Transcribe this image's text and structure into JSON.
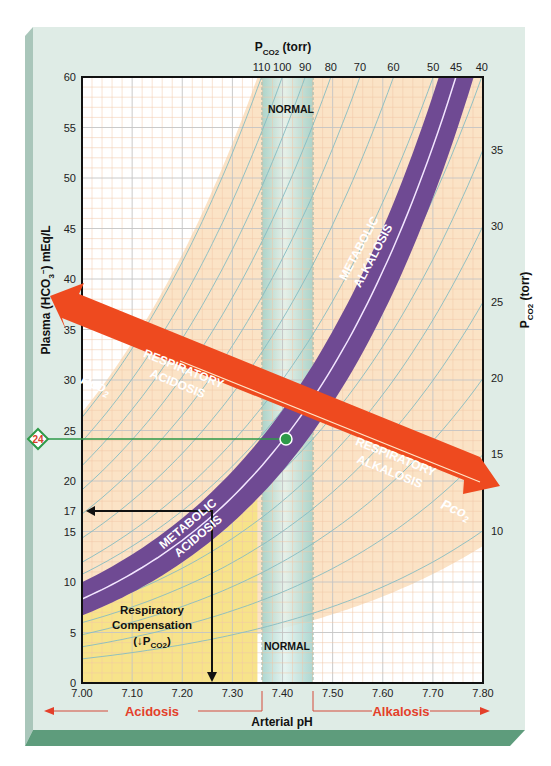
{
  "chart_data": {
    "type": "line",
    "xlabel": "Arterial pH",
    "ylabel": "Plasma (HCO3-) mEq/L",
    "top_axis_label": "PCO2 (torr)",
    "right_axis_label": "PCO2 (torr)",
    "xlim": [
      7.0,
      7.8
    ],
    "ylim": [
      0,
      60
    ],
    "x_ticks": [
      "7.00",
      "7.10",
      "7.20",
      "7.30",
      "7.40",
      "7.50",
      "7.60",
      "7.70",
      "7.80"
    ],
    "y_ticks": [
      "0",
      "5",
      "10",
      "15",
      "17",
      "20",
      "25",
      "30",
      "35",
      "40",
      "45",
      "50",
      "55",
      "60"
    ],
    "top_pco2_ticks": [
      "110",
      "100",
      "90",
      "80",
      "70",
      "60",
      "50",
      "45",
      "40"
    ],
    "right_pco2_ticks": [
      "35",
      "30",
      "25",
      "20",
      "15",
      "10"
    ],
    "isopleths_pco2": [
      110,
      100,
      90,
      80,
      70,
      60,
      50,
      45,
      40,
      35,
      30,
      25,
      20,
      15,
      10
    ],
    "normal_band_ph": [
      7.35,
      7.45
    ],
    "normal_point": {
      "ph": 7.4,
      "hco3": 24,
      "pco2": 40
    },
    "example_point": {
      "ph": 7.25,
      "hco3": 17
    },
    "regions": [
      {
        "name": "Metabolic alkalosis",
        "type": "band"
      },
      {
        "name": "Metabolic acidosis",
        "type": "band"
      },
      {
        "name": "Respiratory acidosis",
        "type": "arrow"
      },
      {
        "name": "Respiratory alkalosis",
        "type": "arrow"
      },
      {
        "name": "Respiratory compensation (↓PCO2)",
        "type": "area"
      }
    ],
    "grid": true
  },
  "labels": {
    "top_axis": "P",
    "top_axis_sub": "CO2",
    "top_axis_suffix": " (torr)",
    "right_axis": "P",
    "right_axis_sub": "CO2",
    "right_axis_suffix": " (torr)",
    "y_axis": "Plasma (HCO",
    "y_axis_sub": "3",
    "y_axis_sup": "−",
    "y_axis_suffix": ") mEq/L",
    "x_axis": "Arterial pH",
    "normal_top": "NORMAL",
    "normal_bottom": "NORMAL",
    "met_alk_1": "METABOLIC",
    "met_alk_2": "ALKALOSIS",
    "met_acid_1": "METABOLIC",
    "met_acid_2": "ACIDOSIS",
    "resp_acid_1": "RESPIRATORY",
    "resp_acid_2": "ACIDOSIS",
    "resp_alk_1": "RESPIRATORY",
    "resp_alk_2": "ALKALOSIS",
    "pco2_arrow_left": "Pco",
    "pco2_arrow_left_sub": "2",
    "pco2_arrow_right": "Pco",
    "pco2_arrow_right_sub": "2",
    "comp_1": "Respiratory",
    "comp_2": "Compensation",
    "comp_3_pre": "(",
    "comp_3_arrow": "↓",
    "comp_3_p": "P",
    "comp_3_sub": "CO2",
    "comp_3_post": ")",
    "diamond_value": "24",
    "acidosis": "Acidosis",
    "alkalosis": "Alkalosis"
  },
  "colors": {
    "card": "#dfece6",
    "card_left_bevel": "#a9c6ba",
    "card_bottom_bevel": "#5e9c7c",
    "plot_white": "#ffffff",
    "peach": "#fbe3c6",
    "yellow": "#f7e38a",
    "normal_band": "#c5e3dc",
    "purple": "#6f4a93",
    "red_arrow": "#ee4a1f",
    "green": "#2e9a48",
    "isopleth": "#7fb9bf",
    "grid_fine": "#f2c9a8",
    "grid_major": "#c9c9c9"
  }
}
